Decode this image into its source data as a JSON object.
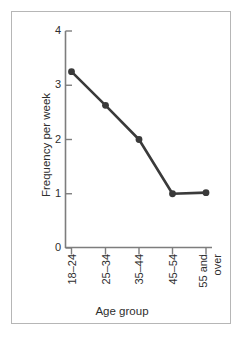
{
  "figure": {
    "frame_color": "#b6b6b6",
    "background": "#ffffff",
    "ink_color": "#3a3a3a"
  },
  "chart_data": {
    "type": "line",
    "title": "",
    "categories": [
      "18–24",
      "25–34",
      "35–44",
      "45–54",
      "55 and over"
    ],
    "values": [
      3.25,
      2.63,
      2.0,
      1.0,
      1.02
    ],
    "xlabel": "Age group",
    "ylabel": "Frequency per week",
    "ylim": [
      0,
      4
    ],
    "yticks": [
      0,
      1,
      2,
      3,
      4
    ],
    "ytick_labels": [
      "0",
      "1",
      "2",
      "3",
      "4"
    ],
    "grid": false,
    "legend": null,
    "marker": "circle",
    "line_color": "#3a3a3a",
    "marker_color": "#3a3a3a"
  },
  "xtick_label_lines": [
    [
      "18–24"
    ],
    [
      "25–34"
    ],
    [
      "35–44"
    ],
    [
      "45–54"
    ],
    [
      "55 and",
      "over"
    ]
  ]
}
